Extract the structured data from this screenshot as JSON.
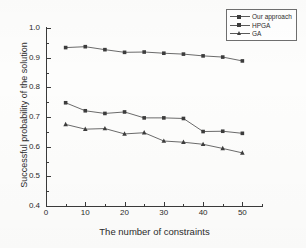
{
  "chart_data": {
    "type": "line",
    "title": "",
    "xlabel": "The number of constraints",
    "ylabel": "Successful probability of the solution",
    "x": [
      5,
      10,
      15,
      20,
      25,
      30,
      35,
      40,
      45,
      50
    ],
    "xlim": [
      0,
      55
    ],
    "ylim": [
      0.4,
      1.0
    ],
    "xticks": [
      0,
      10,
      20,
      30,
      40,
      50
    ],
    "xticks_minor": [
      5,
      15,
      25,
      35,
      45,
      55
    ],
    "yticks": [
      "1.0",
      "0.9",
      "0.8",
      "0.7",
      "0.6",
      "0.5",
      "0.4"
    ],
    "yticks_values": [
      1.0,
      0.9,
      0.8,
      0.7,
      0.6,
      0.5,
      0.4
    ],
    "yticks_minor": [
      0.95,
      0.85,
      0.75,
      0.65,
      0.55,
      0.45
    ],
    "grid": false,
    "legend_position": "top-right",
    "series": [
      {
        "name": "Our approach",
        "marker": "square",
        "values": [
          0.934,
          0.937,
          0.927,
          0.918,
          0.919,
          0.915,
          0.912,
          0.906,
          0.902,
          0.889
        ]
      },
      {
        "name": "HPGA",
        "marker": "square",
        "values": [
          0.748,
          0.721,
          0.712,
          0.717,
          0.697,
          0.697,
          0.695,
          0.651,
          0.652,
          0.645
        ]
      },
      {
        "name": "GA",
        "marker": "triangle",
        "values": [
          0.675,
          0.659,
          0.661,
          0.643,
          0.647,
          0.619,
          0.615,
          0.608,
          0.594,
          0.579
        ]
      }
    ]
  },
  "legend": {
    "entries": [
      {
        "label": "Our approach"
      },
      {
        "label": "HPGA"
      },
      {
        "label": "GA"
      }
    ]
  },
  "axes": {
    "x_title": "The number of constraints",
    "y_title": "Successful probability of the solution"
  }
}
